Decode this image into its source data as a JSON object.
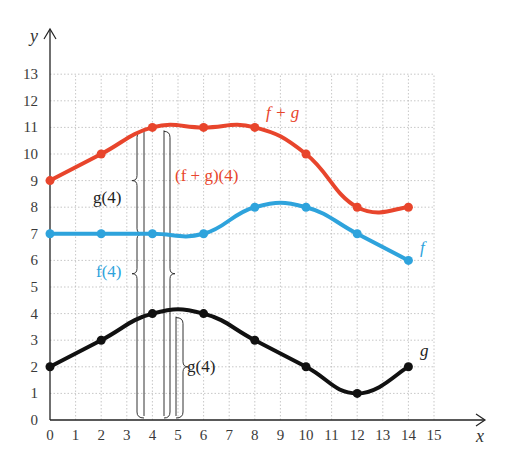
{
  "chart_data": {
    "type": "line",
    "title": "",
    "xlabel": "x",
    "ylabel": "y",
    "xlim": [
      0,
      15
    ],
    "ylim": [
      0,
      13
    ],
    "grid": true,
    "x_ticks": [
      "0",
      "1",
      "2",
      "3",
      "4",
      "5",
      "6",
      "7",
      "8",
      "9",
      "10",
      "11",
      "12",
      "13",
      "14",
      "15"
    ],
    "y_ticks": [
      "0",
      "1",
      "2",
      "3",
      "4",
      "5",
      "6",
      "7",
      "8",
      "9",
      "10",
      "11",
      "12",
      "13"
    ],
    "series": [
      {
        "name": "f + g",
        "label": "f + g",
        "color": "#e8452c",
        "points": [
          [
            0,
            9
          ],
          [
            2,
            10
          ],
          [
            4,
            11
          ],
          [
            6,
            11
          ],
          [
            8,
            11
          ],
          [
            10,
            10
          ],
          [
            12,
            8
          ],
          [
            14,
            8
          ]
        ]
      },
      {
        "name": "f",
        "label": "f",
        "color": "#2ea3dc",
        "points": [
          [
            0,
            7
          ],
          [
            2,
            7
          ],
          [
            4,
            7
          ],
          [
            6,
            7
          ],
          [
            8,
            8
          ],
          [
            10,
            8
          ],
          [
            12,
            7
          ],
          [
            14,
            6
          ]
        ]
      },
      {
        "name": "g",
        "label": "g",
        "color": "#111111",
        "points": [
          [
            0,
            2
          ],
          [
            2,
            3
          ],
          [
            4,
            4
          ],
          [
            6,
            4
          ],
          [
            8,
            3
          ],
          [
            10,
            2
          ],
          [
            12,
            1
          ],
          [
            14,
            2
          ]
        ]
      }
    ],
    "annotations": [
      {
        "text": "(f + g)(4)",
        "color": "#e8452c",
        "from_y": 0,
        "to_y": 11,
        "x": 4
      },
      {
        "text": "g(4)",
        "color": "#222222",
        "from_y": 7,
        "to_y": 11,
        "x": 4
      },
      {
        "text": "f(4)",
        "color": "#2ea3dc",
        "from_y": 0,
        "to_y": 7,
        "x": 4
      },
      {
        "text": "g(4)",
        "color": "#222222",
        "from_y": 0,
        "to_y": 4,
        "x": 4
      }
    ]
  }
}
